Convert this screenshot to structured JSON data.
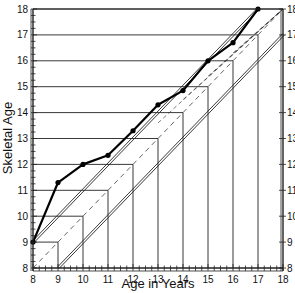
{
  "chart_data": {
    "type": "line",
    "title": "",
    "xlabel": "Age in Years",
    "ylabel": "Skeletal Age",
    "xlim": [
      8,
      18
    ],
    "ylim": [
      8,
      18
    ],
    "x_ticks": [
      "8",
      "9",
      "10",
      "11",
      "12",
      "13",
      "14",
      "15",
      "16",
      "17",
      "18"
    ],
    "y_ticks": [
      "8",
      "9",
      "10",
      "11",
      "12",
      "13",
      "14",
      "15",
      "16",
      "17",
      "18"
    ],
    "grid": false,
    "series": [
      {
        "name": "Skeletal age",
        "style": "solid-bold-with-markers",
        "x": [
          8,
          9,
          10,
          11,
          12,
          13,
          14,
          15,
          16,
          17
        ],
        "values": [
          9.0,
          11.3,
          12.0,
          12.35,
          13.3,
          14.3,
          14.85,
          16.0,
          16.7,
          18.0
        ]
      }
    ],
    "reference_lines": [
      {
        "name": "upper-bound",
        "style": "double",
        "from": [
          8,
          9
        ],
        "to": [
          17,
          18
        ]
      },
      {
        "name": "equality",
        "style": "dashed",
        "from": [
          8,
          8
        ],
        "to": [
          18,
          18
        ]
      },
      {
        "name": "lower-bound",
        "style": "double",
        "from": [
          9,
          8
        ],
        "to": [
          18,
          17
        ]
      }
    ],
    "boxes": [
      9,
      10,
      11,
      12,
      13,
      14,
      15,
      16,
      17
    ]
  }
}
